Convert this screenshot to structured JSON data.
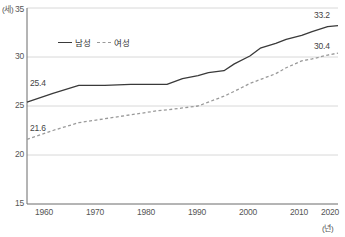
{
  "chart_data": {
    "type": "line",
    "title": "",
    "xlabel": "(년)",
    "ylabel": "(세)",
    "xlim": [
      1960,
      2020
    ],
    "ylim": [
      15,
      35
    ],
    "y_ticks": [
      "15",
      "20",
      "25",
      "30",
      "35"
    ],
    "y_tick_values": [
      15,
      20,
      25,
      30,
      35
    ],
    "x_ticks": [
      "1960",
      "1970",
      "1980",
      "1990",
      "2000",
      "2010",
      "2020"
    ],
    "x_tick_values": [
      1960,
      1970,
      1980,
      1990,
      2000,
      2010,
      2020
    ],
    "grid": "horizontal",
    "legend_position": "upper-left-inside",
    "x": [
      1960,
      1965,
      1970,
      1975,
      1980,
      1985,
      1987,
      1990,
      1993,
      1995,
      1998,
      2000,
      2003,
      2005,
      2008,
      2010,
      2013,
      2015,
      2018,
      2020
    ],
    "series": [
      {
        "name": "남성",
        "style": "solid",
        "color": "#3a3a3a",
        "values": [
          25.4,
          26.3,
          27.1,
          27.1,
          27.2,
          27.2,
          27.2,
          27.8,
          28.1,
          28.4,
          28.6,
          29.3,
          30.1,
          30.9,
          31.4,
          31.8,
          32.2,
          32.6,
          33.1,
          33.2
        ]
      },
      {
        "name": "여성",
        "style": "dashed",
        "color": "#9a9a9a",
        "values": [
          21.6,
          22.5,
          23.3,
          23.7,
          24.1,
          24.5,
          24.6,
          24.8,
          25.0,
          25.4,
          26.0,
          26.5,
          27.3,
          27.7,
          28.3,
          28.9,
          29.6,
          29.8,
          30.2,
          30.4
        ]
      }
    ],
    "annotations": [
      {
        "name": "male-start-label",
        "text": "25.4",
        "x": 1960,
        "y": 25.4
      },
      {
        "name": "female-start-label",
        "text": "21.6",
        "x": 1960,
        "y": 21.6
      },
      {
        "name": "male-end-label",
        "text": "33.2",
        "x": 2020,
        "y": 33.2
      },
      {
        "name": "female-end-label",
        "text": "30.4",
        "x": 2020,
        "y": 30.4
      }
    ]
  },
  "labels": {
    "y_unit": "(세)",
    "x_unit": "(년)",
    "y_ticks": [
      "35",
      "30",
      "25",
      "20",
      "15"
    ],
    "x_ticks": [
      "1960",
      "1970",
      "1980",
      "1990",
      "2000",
      "2010",
      "2020"
    ],
    "legend": [
      {
        "label": "남성",
        "style": "solid"
      },
      {
        "label": "여성",
        "style": "dashed"
      }
    ],
    "annotations": [
      "25.4",
      "21.6",
      "33.2",
      "30.4"
    ]
  },
  "colors": {
    "male_line": "#3a3a3a",
    "female_line": "#9a9a9a",
    "axis": "#6b6b6b",
    "grid": "#d8d8d8",
    "text": "#555555"
  }
}
